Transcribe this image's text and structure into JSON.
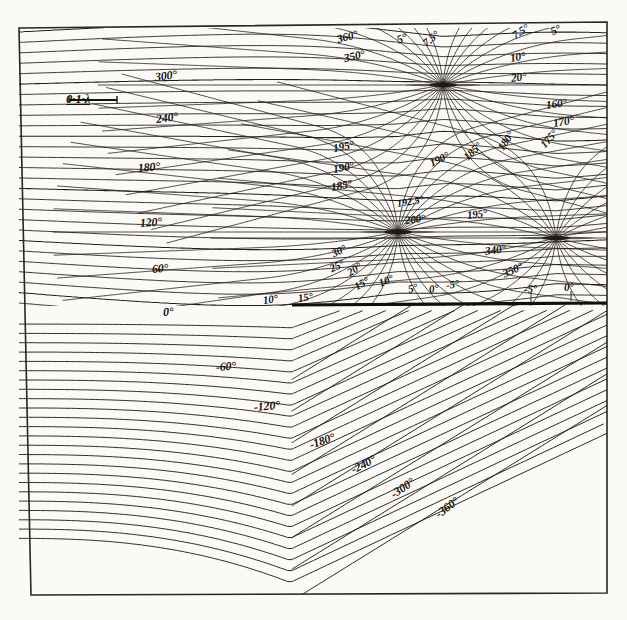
{
  "figure": {
    "kind": "contour-plot",
    "background_color": "#fbfaf7",
    "ink_color": "#15130f",
    "frame": {
      "x": 19,
      "y": 28,
      "width": 588,
      "height": 566
    }
  },
  "scale_bar": {
    "label": "0·1·λ",
    "x": 66,
    "y": 92,
    "bar_length_px": 48
  },
  "screen_edge": {
    "name": "half-plane-screen-edge",
    "x_start": 292,
    "x_end": 607,
    "y": 305,
    "thickness": 3.2
  },
  "singularities": [
    {
      "id": "s1",
      "x": 443,
      "y": 85,
      "label": "phase-singularity-top"
    },
    {
      "id": "s2",
      "x": 398,
      "y": 232,
      "label": "phase-singularity-middle"
    },
    {
      "id": "s3",
      "x": 556,
      "y": 238,
      "label": "phase-singularity-right"
    }
  ],
  "chart_data": {
    "type": "contour",
    "title": "",
    "xlabel": "",
    "ylabel": "",
    "units": "degrees",
    "scale_reference": "0.1 lambda",
    "contour_interval_coarse": 60,
    "levels_labeled": [
      360,
      350,
      300,
      240,
      200,
      195,
      192.5,
      190,
      185,
      180,
      175,
      170,
      160,
      120,
      60,
      30,
      25,
      20,
      15,
      10,
      7.5,
      5,
      0,
      -5,
      -60,
      -120,
      -180,
      -240,
      -300,
      -360,
      340
    ],
    "families": [
      {
        "name": "upper-left-horizontal-band",
        "levels": [
          300,
          240,
          180,
          120,
          60,
          0
        ]
      },
      {
        "name": "top-singularity-fan",
        "levels": [
          360,
          350,
          5,
          7.5,
          10,
          20,
          160,
          170,
          175,
          180
        ]
      },
      {
        "name": "middle-singularity-fan",
        "levels": [
          195,
          192.5,
          190,
          185,
          200,
          30,
          25,
          20,
          15,
          10,
          5,
          0,
          -5
        ]
      },
      {
        "name": "right-singularity-fan",
        "levels": [
          340,
          350,
          -5,
          0
        ]
      },
      {
        "name": "lower-half-arcs",
        "levels": [
          0,
          -60,
          -120,
          -180,
          -240,
          -300,
          -360
        ]
      }
    ]
  },
  "labels": [
    {
      "text": "300°",
      "x": 155,
      "y": 70,
      "rot": -7,
      "size": 12.0
    },
    {
      "text": "240°",
      "x": 156,
      "y": 112,
      "rot": -7,
      "size": 12.0
    },
    {
      "text": "180°",
      "x": 138,
      "y": 161,
      "rot": -5,
      "size": 12.0
    },
    {
      "text": "120°",
      "x": 140,
      "y": 216,
      "rot": -4,
      "size": 12.0
    },
    {
      "text": "60°",
      "x": 152,
      "y": 262,
      "rot": -4,
      "size": 12.0
    },
    {
      "text": "0°",
      "x": 163,
      "y": 305,
      "rot": -3,
      "size": 12.0
    },
    {
      "text": "360°",
      "x": 337,
      "y": 33,
      "rot": -14,
      "size": 11.5
    },
    {
      "text": "350°",
      "x": 344,
      "y": 52,
      "rot": -12,
      "size": 11.5
    },
    {
      "text": "5°",
      "x": 397,
      "y": 34,
      "rot": -22,
      "size": 11.5
    },
    {
      "text": "7.5°",
      "x": 424,
      "y": 38,
      "rot": -40,
      "size": 11.0
    },
    {
      "text": "7.5°",
      "x": 513,
      "y": 30,
      "rot": -34,
      "size": 11.0
    },
    {
      "text": "5°",
      "x": 551,
      "y": 26,
      "rot": -26,
      "size": 11.5
    },
    {
      "text": "10°",
      "x": 510,
      "y": 52,
      "rot": -9,
      "size": 11.5
    },
    {
      "text": "20°",
      "x": 511,
      "y": 72,
      "rot": -8,
      "size": 11.5
    },
    {
      "text": "160°",
      "x": 546,
      "y": 99,
      "rot": -8,
      "size": 11.5
    },
    {
      "text": "170°",
      "x": 553,
      "y": 117,
      "rot": -9,
      "size": 11.5
    },
    {
      "text": "175°",
      "x": 542,
      "y": 140,
      "rot": -48,
      "size": 11.0
    },
    {
      "text": "180°",
      "x": 500,
      "y": 143,
      "rot": -56,
      "size": 11.0
    },
    {
      "text": "185°",
      "x": 465,
      "y": 152,
      "rot": -44,
      "size": 11.0
    },
    {
      "text": "190°",
      "x": 430,
      "y": 157,
      "rot": -25,
      "size": 11.0
    },
    {
      "text": "195°",
      "x": 333,
      "y": 142,
      "rot": -10,
      "size": 11.5
    },
    {
      "text": "190°",
      "x": 333,
      "y": 163,
      "rot": -10,
      "size": 11.5
    },
    {
      "text": "185°",
      "x": 331,
      "y": 181,
      "rot": -10,
      "size": 11.5
    },
    {
      "text": "192.5°",
      "x": 397,
      "y": 198,
      "rot": -9,
      "size": 10.5
    },
    {
      "text": "200°",
      "x": 405,
      "y": 214,
      "rot": -6,
      "size": 11.0
    },
    {
      "text": "195°",
      "x": 467,
      "y": 209,
      "rot": -7,
      "size": 11.0
    },
    {
      "text": "30°",
      "x": 332,
      "y": 248,
      "rot": -26,
      "size": 11.0
    },
    {
      "text": "25°",
      "x": 330,
      "y": 263,
      "rot": -26,
      "size": 11.0
    },
    {
      "text": "20°",
      "x": 348,
      "y": 267,
      "rot": -32,
      "size": 11.0
    },
    {
      "text": "15°",
      "x": 355,
      "y": 281,
      "rot": -30,
      "size": 11.0
    },
    {
      "text": "10°",
      "x": 379,
      "y": 277,
      "rot": -22,
      "size": 11.0
    },
    {
      "text": "5°",
      "x": 408,
      "y": 283,
      "rot": -14,
      "size": 11.0
    },
    {
      "text": "0°",
      "x": 429,
      "y": 283,
      "rot": -8,
      "size": 11.0
    },
    {
      "text": "-5°",
      "x": 446,
      "y": 279,
      "rot": -8,
      "size": 11.0
    },
    {
      "text": "10°",
      "x": 263,
      "y": 294,
      "rot": -8,
      "size": 11.0
    },
    {
      "text": "15°",
      "x": 298,
      "y": 292,
      "rot": -8,
      "size": 11.0
    },
    {
      "text": "340°",
      "x": 485,
      "y": 245,
      "rot": -8,
      "size": 11.5
    },
    {
      "text": "350°",
      "x": 503,
      "y": 268,
      "rot": -24,
      "size": 11.5
    },
    {
      "text": "-5°",
      "x": 524,
      "y": 283,
      "rot": -3,
      "size": 11.0
    },
    {
      "text": "0°",
      "x": 564,
      "y": 281,
      "rot": -3,
      "size": 11.0
    },
    {
      "text": "-60°",
      "x": 216,
      "y": 360,
      "rot": -4,
      "size": 12.0
    },
    {
      "text": "-120°",
      "x": 254,
      "y": 400,
      "rot": -5,
      "size": 12.0
    },
    {
      "text": "-180°",
      "x": 310,
      "y": 438,
      "rot": -19,
      "size": 12.0
    },
    {
      "text": "-240°",
      "x": 352,
      "y": 463,
      "rot": -27,
      "size": 12.0
    },
    {
      "text": "-300°",
      "x": 392,
      "y": 488,
      "rot": -34,
      "size": 12.0
    },
    {
      "text": "-360°",
      "x": 437,
      "y": 508,
      "rot": -37,
      "size": 12.0
    }
  ]
}
